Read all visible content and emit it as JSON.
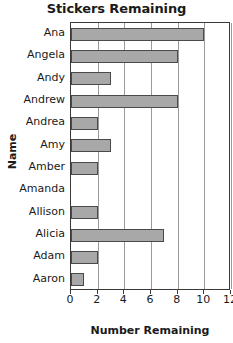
{
  "chart_data": {
    "type": "bar",
    "orientation": "horizontal",
    "title": "Stickers Remaining",
    "xlabel": "Number Remaining",
    "ylabel": "Name",
    "categories": [
      "Ana",
      "Angela",
      "Andy",
      "Andrew",
      "Andrea",
      "Amy",
      "Amber",
      "Amanda",
      "Allison",
      "Alicia",
      "Adam",
      "Aaron"
    ],
    "values": [
      10,
      8,
      3,
      8,
      2,
      3,
      2,
      0,
      2,
      7,
      2,
      1
    ],
    "xlim": [
      0,
      12
    ],
    "xticks": [
      0,
      2,
      4,
      6,
      8,
      10,
      12
    ],
    "xtick_labels": [
      "0",
      "2",
      "4",
      "6",
      "8",
      "10",
      "12"
    ],
    "grid": "vertical",
    "legend": "none",
    "bar_color": "#a8a8a8",
    "bar_edge_color": "#4a4a4a",
    "frame_color": "#3a3a3a",
    "gridline_color": "#9a9a9a",
    "background": "#ffffff"
  }
}
